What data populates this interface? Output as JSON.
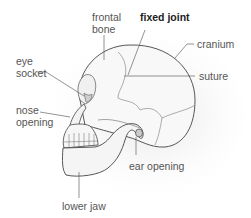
{
  "diagram": {
    "labels": {
      "frontal_bone_line1": "frontal",
      "frontal_bone_line2": "bone",
      "fixed_joint": "fixed joint",
      "cranium": "cranium",
      "eye_socket_line1": "eye",
      "eye_socket_line2": "socket",
      "suture": "suture",
      "nose_opening_line1": "nose",
      "nose_opening_line2": "opening",
      "ear_opening": "ear opening",
      "lower_jaw": "lower jaw"
    },
    "colors": {
      "bone_fill": "#f7f7f7",
      "outline": "#444444",
      "leader": "#666666",
      "shadow": "#e6e6e6"
    }
  }
}
